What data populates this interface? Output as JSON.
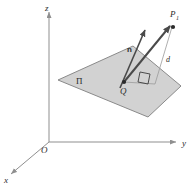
{
  "figure": {
    "background_color": "#ffffff",
    "axes": {
      "color": "#8f8f8f",
      "origin_label": "O",
      "labels": {
        "x": "x",
        "y": "y",
        "z": "z"
      }
    },
    "plane": {
      "label": "Π",
      "fill_color": "#d2d2d2",
      "stroke_color": "#8a8a8a",
      "points": "58,80 133,46 181,86 148,117"
    },
    "points": [
      {
        "name": "Q",
        "label": "Q",
        "subscript": ""
      },
      {
        "name": "P1",
        "label": "P",
        "subscript": "1"
      }
    ],
    "vectors": [
      {
        "name": "normal",
        "label": "n",
        "style": "bold"
      },
      {
        "name": "QP1",
        "label": "",
        "style": "bold"
      }
    ],
    "segments": [
      {
        "name": "distance",
        "label": "d",
        "style": "italic"
      }
    ],
    "markers": [
      {
        "name": "right-angle",
        "label": ""
      }
    ],
    "stroke_color": "#4a4a4a",
    "thin_stroke_color": "#9a9a9a"
  }
}
